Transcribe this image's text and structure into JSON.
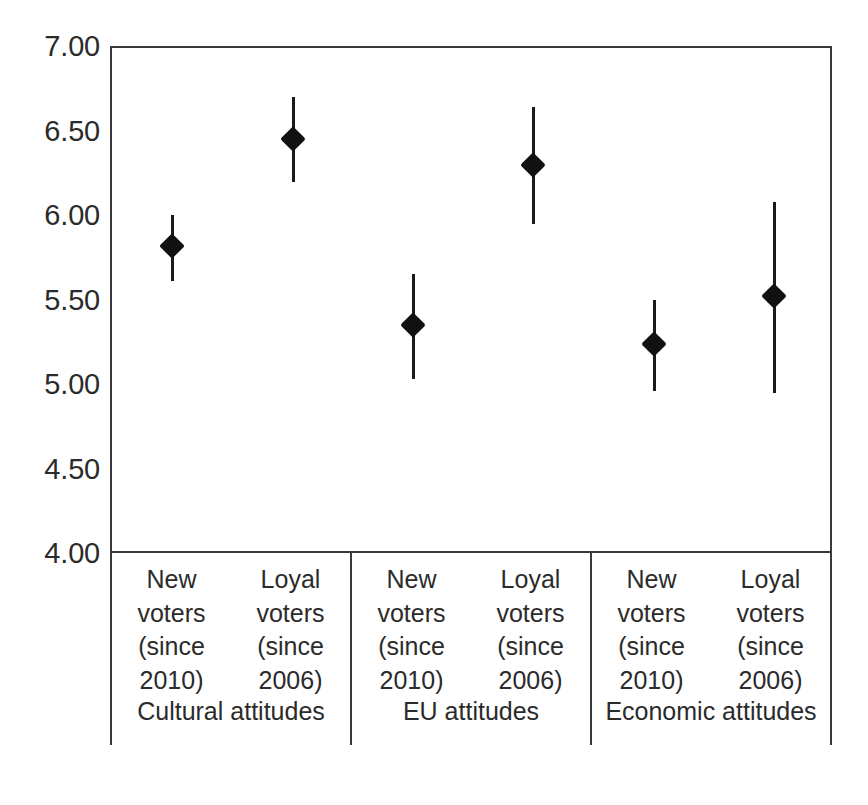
{
  "chart_data": {
    "type": "scatter",
    "title": "",
    "xlabel": "",
    "ylabel": "",
    "ylim": [
      4.0,
      7.0
    ],
    "ytick_labels": [
      "7.00",
      "6.50",
      "6.00",
      "5.50",
      "5.00",
      "4.50",
      "4.00"
    ],
    "ytick_values": [
      7.0,
      6.5,
      6.0,
      5.5,
      5.0,
      4.5,
      4.0
    ],
    "grid": false,
    "legend": "none",
    "error_bars": "vertical confidence intervals",
    "marker": "filled diamond",
    "marker_color": "#111111",
    "axis_color": "#3a3a3a",
    "groups": [
      {
        "name": "Cultural attitudes",
        "points": [
          {
            "category": "New voters (since 2010)",
            "category_lines": [
              "New",
              "voters",
              "(since",
              "2010)"
            ],
            "value": 5.83,
            "low": 5.62,
            "high": 6.01
          },
          {
            "category": "Loyal voters (since 2006)",
            "category_lines": [
              "Loyal",
              "voters",
              "(since",
              "2006)"
            ],
            "value": 6.46,
            "low": 6.21,
            "high": 6.71
          }
        ]
      },
      {
        "name": "EU attitudes",
        "points": [
          {
            "category": "New voters (since 2010)",
            "category_lines": [
              "New",
              "voters",
              "(since",
              "2010)"
            ],
            "value": 5.36,
            "low": 5.04,
            "high": 5.66
          },
          {
            "category": "Loyal voters (since 2006)",
            "category_lines": [
              "Loyal",
              "voters",
              "(since",
              "2006)"
            ],
            "value": 6.31,
            "low": 5.96,
            "high": 6.65
          }
        ]
      },
      {
        "name": "Economic attitudes",
        "points": [
          {
            "category": "New voters (since 2010)",
            "category_lines": [
              "New",
              "voters",
              "(since",
              "2010)"
            ],
            "value": 5.25,
            "low": 4.97,
            "high": 5.51
          },
          {
            "category": "Loyal voters (since 2006)",
            "category_lines": [
              "Loyal",
              "voters",
              "(since",
              "2006)"
            ],
            "value": 5.53,
            "low": 4.96,
            "high": 6.09
          }
        ]
      }
    ]
  }
}
